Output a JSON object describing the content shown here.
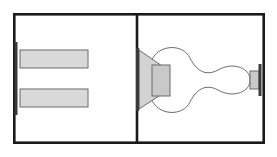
{
  "figure": {
    "title": "Two-panel technical cross-section diagram",
    "canvas": {
      "width": 277,
      "height": 157
    },
    "background_color": "#ffffff",
    "style": {
      "frame_color": "#1a1a1a",
      "frame_stroke_width": 2.6,
      "outline_color": "#6b6b6b",
      "outline_stroke_width": 1.0,
      "fill_light_gray": "#d9d9d9",
      "fill_mid_gray": "#c9c9c9",
      "bar_color": "#3a3a3a"
    },
    "frame": {
      "label": "outer-frame",
      "x": 13,
      "y": 13,
      "width": 252,
      "height": 131
    },
    "divider": {
      "label": "center-divider",
      "x": 137,
      "y_top": 13,
      "y_bottom": 144
    },
    "panels": [
      {
        "id": "left-panel",
        "label": "Left panel",
        "x": 13,
        "y": 13,
        "width": 124,
        "height": 131,
        "elements": [
          {
            "name": "left-edge-bar",
            "type": "vertical-bar",
            "x": 14.5,
            "y": 42,
            "width": 3.0,
            "height": 73,
            "fill": "#3a3a3a"
          },
          {
            "name": "upper-plate",
            "type": "rectangle",
            "x": 20,
            "y": 50,
            "width": 68,
            "height": 18,
            "fill": "#d9d9d9",
            "stroke": "#6b6b6b"
          },
          {
            "name": "lower-plate",
            "type": "rectangle",
            "x": 20,
            "y": 89,
            "width": 68,
            "height": 18,
            "fill": "#d9d9d9",
            "stroke": "#6b6b6b"
          }
        ]
      },
      {
        "id": "right-panel",
        "label": "Right panel",
        "x": 137,
        "y": 13,
        "width": 128,
        "height": 131,
        "elements": [
          {
            "name": "divider-edge-bar",
            "type": "vertical-bar",
            "x": 136.0,
            "y": 48,
            "width": 3.2,
            "height": 63,
            "fill": "#3a3a3a"
          },
          {
            "name": "funnel-trapezoid",
            "type": "polygon",
            "points": "139,50 165,68 165,92 139,109",
            "fill": "#d3d3d3",
            "stroke": "#6b6b6b"
          },
          {
            "name": "funnel-core-block",
            "type": "rectangle",
            "x": 152,
            "y": 65,
            "width": 18,
            "height": 31,
            "fill": "#c9c9c9",
            "stroke": "#6b6b6b"
          },
          {
            "name": "gourd-outline",
            "type": "closed-curve",
            "description": "Symmetric gourd / peanut profile with two lobes and a central waist",
            "fill": "#ffffff",
            "stroke": "#6b6b6b",
            "top_path": "M 151,62 C 157,44 183,43 190,58 C 196,70 205,77 218,70 C 232,62 248,67 250,78",
            "bottom_path": "M 151,98 C 157,116 183,117 190,102 C 196,90 205,83 218,90 C 232,98 248,93 250,82",
            "right_cap": "M 250,78 L 250,82"
          },
          {
            "name": "right-neck-block",
            "type": "rectangle",
            "x": 250,
            "y": 71,
            "width": 9,
            "height": 18,
            "fill": "#c9c9c9",
            "stroke": "#6b6b6b"
          },
          {
            "name": "right-edge-bar",
            "type": "vertical-bar",
            "x": 258.5,
            "y": 64,
            "width": 3.0,
            "height": 32,
            "fill": "#3a3a3a"
          }
        ]
      }
    ]
  }
}
